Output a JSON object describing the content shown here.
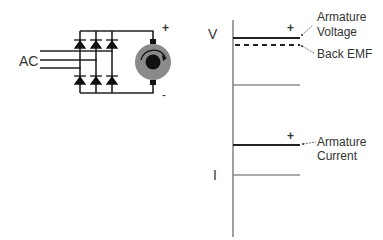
{
  "circuit": {
    "ac_label": "AC",
    "plus_label": "+",
    "minus_label": "-",
    "motor_fill": "#8a8a8a",
    "rotor_fill": "#111111"
  },
  "plot": {
    "v_axis_label": "V",
    "i_axis_label": "I",
    "voltage_plus": "+",
    "current_plus": "+",
    "annotations": {
      "armature_voltage_line1": "Armature",
      "armature_voltage_line2": "Voltage",
      "back_emf": "Back EMF",
      "armature_current_line1": "Armature",
      "armature_current_line2": "Current"
    },
    "colors": {
      "signal": "#222222",
      "zero_line": "#8c8c8c",
      "axis": "#777777"
    }
  }
}
